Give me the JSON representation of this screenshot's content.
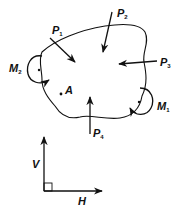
{
  "diagram": {
    "body_outline": "irregular closed body",
    "forces": [
      {
        "id": "P1",
        "symbol": "P",
        "subscript": "1",
        "direction": "down-right, into body"
      },
      {
        "id": "P2",
        "symbol": "P",
        "subscript": "2",
        "direction": "down, into body"
      },
      {
        "id": "P3",
        "symbol": "P",
        "subscript": "3",
        "direction": "left, into body"
      },
      {
        "id": "P4",
        "symbol": "P",
        "subscript": "4",
        "direction": "up, into body"
      }
    ],
    "moments": [
      {
        "id": "M1",
        "symbol": "M",
        "subscript": "1",
        "sense": "counterclockwise"
      },
      {
        "id": "M2",
        "symbol": "M",
        "subscript": "2",
        "sense": "clockwise"
      }
    ],
    "point": {
      "label": "A"
    },
    "axes": {
      "vertical": "V",
      "horizontal": "H",
      "right_angle_marker": true
    },
    "colors": {
      "ink": "#111111",
      "background": "#ffffff"
    }
  }
}
